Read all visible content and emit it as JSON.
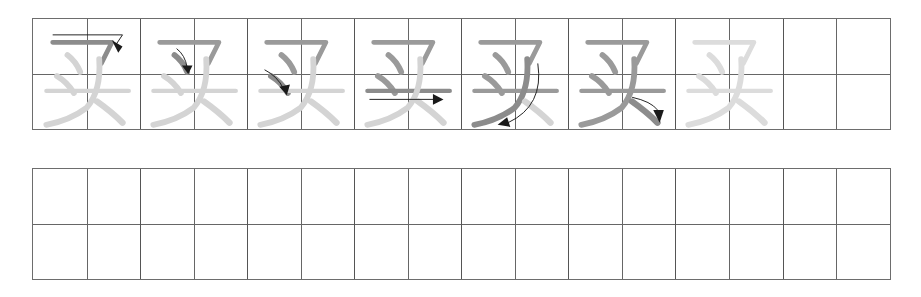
{
  "worksheet": {
    "character": "买",
    "stroke_count": 6,
    "colors": {
      "grid_line": "#666666",
      "stroke_done": "#9a9a9a",
      "stroke_current": "#8c8c8c",
      "stroke_pending": "#d4d4d4",
      "arrow": "#1a1a1a",
      "faded_full": "#dcdcdc"
    },
    "top_row": {
      "cells": [
        {
          "index": 1,
          "label": "stroke-1",
          "highlight": "heng-pie (horizontal-hook)",
          "arrow": "right then down-left"
        },
        {
          "index": 2,
          "label": "stroke-2",
          "highlight": "dot",
          "arrow": "down-right"
        },
        {
          "index": 3,
          "label": "stroke-3",
          "highlight": "dot",
          "arrow": "down-right"
        },
        {
          "index": 4,
          "label": "stroke-4",
          "highlight": "horizontal",
          "arrow": "right"
        },
        {
          "index": 5,
          "label": "stroke-5",
          "highlight": "left-falling (pie)",
          "arrow": "down-left curve"
        },
        {
          "index": 6,
          "label": "stroke-6",
          "highlight": "right-falling dot",
          "arrow": "down-right"
        },
        {
          "index": 7,
          "label": "trace-full",
          "highlight": "none",
          "arrow": "none"
        },
        {
          "index": 8,
          "label": "empty",
          "highlight": "none",
          "arrow": "none"
        }
      ]
    },
    "bottom_row": {
      "columns": 16,
      "label": "practice-grid"
    }
  }
}
